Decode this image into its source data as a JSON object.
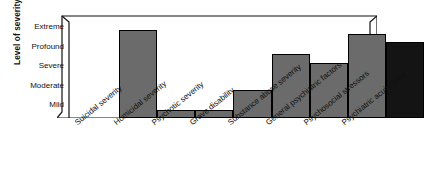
{
  "chart": {
    "ylabel": "Level of severity",
    "y_ticks": [
      "Extreme",
      "Profound",
      "Severe",
      "Moderate",
      "Mild"
    ]
  },
  "chart_data": {
    "type": "bar",
    "title": "",
    "xlabel": "",
    "ylabel": "Level of severity",
    "grid": false,
    "legend": "none",
    "categories": [
      "Suicidal severity",
      "Homicidal severity",
      "Psychotic severity",
      "Grave disability",
      "Substance abuse severity",
      "General psychiatric factors",
      "Psychosocial stressors",
      "Psychiatric acuity level"
    ],
    "ytick_labels": [
      "Mild",
      "Moderate",
      "Severe",
      "Profound",
      "Extreme"
    ],
    "ytick_values": [
      1,
      2,
      3,
      4,
      5
    ],
    "ylim": [
      0,
      5.4
    ],
    "values": [
      4.85,
      0.42,
      0.42,
      1.55,
      3.55,
      3.05,
      4.65,
      4.2
    ],
    "bar_colors": [
      "#6b6b6b",
      "#6b6b6b",
      "#6b6b6b",
      "#6b6b6b",
      "#6b6b6b",
      "#6b6b6b",
      "#6b6b6b",
      "#141414"
    ]
  }
}
